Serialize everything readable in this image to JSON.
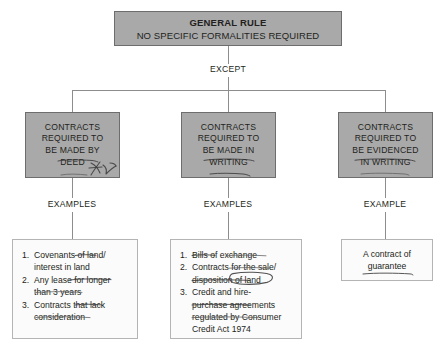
{
  "diagram": {
    "title_box": {
      "line1": "GENERAL RULE",
      "line2": "NO SPECIFIC FORMALITIES REQUIRED"
    },
    "except_label": "EXCEPT",
    "categories": [
      {
        "id": "deed",
        "lines": [
          "CONTRACTS",
          "REQUIRED TO",
          "BE MADE BY",
          "DEED"
        ],
        "examples_label": "EXAMPLES",
        "annotation": "handwritten-scribble"
      },
      {
        "id": "in-writing",
        "lines": [
          "CONTRACTS",
          "REQUIRED TO",
          "BE MADE IN",
          "WRITING"
        ],
        "examples_label": "EXAMPLES"
      },
      {
        "id": "evidenced-in-writing",
        "lines": [
          "CONTRACTS",
          "REQUIRED TO",
          "BE EVIDENCED",
          "IN WRITING"
        ],
        "examples_label": "EXAMPLE"
      }
    ],
    "examples_deed": {
      "items": [
        {
          "num": "1.",
          "lines": [
            "Covenants of land/",
            "interest in land"
          ]
        },
        {
          "num": "2.",
          "lines": [
            "Any lease for longer",
            "than 3 years"
          ]
        },
        {
          "num": "3.",
          "lines": [
            "Contracts that lack",
            "consideration"
          ]
        }
      ]
    },
    "examples_writing": {
      "items": [
        {
          "num": "1.",
          "lines": [
            "Bills of exchange"
          ]
        },
        {
          "num": "2.",
          "lines": [
            "Contracts for the sale/",
            "disposition of land"
          ]
        },
        {
          "num": "3.",
          "lines": [
            "Credit and hire-",
            "purchase agreements",
            "regulated by Consumer",
            "Credit Act 1974"
          ]
        }
      ]
    },
    "example_evidenced": {
      "lines": [
        "A contract of",
        "guarantee"
      ]
    },
    "colors": {
      "box_fill": "#a9a9a9",
      "box_border": "#6d6d6d",
      "list_fill": "#fbfbfb",
      "list_border": "#b4b4b4",
      "connector": "#8d8d8d",
      "text": "#231f20",
      "pencil": "#5e5e5e"
    }
  }
}
